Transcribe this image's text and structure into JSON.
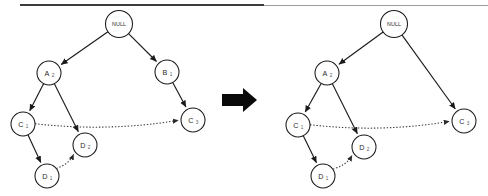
{
  "figure": {
    "canvas": {
      "width": 488,
      "height": 196
    },
    "divider": {
      "name": "top-horizontal-rule",
      "thick_from_x": 20,
      "thick_to_x": 264,
      "thin_to_x": 488,
      "y": 5
    },
    "transition_arrow": {
      "name": "transformation-arrow",
      "glyph": "right-arrow",
      "color": "#0a0a0a"
    },
    "colors": {
      "node_stroke": "#1a1a1a",
      "node_fill": "#ffffff",
      "solid_edge": "#1a1a1a",
      "dotted_edge": "#3a3a3a",
      "label_text": "#2b2b2b",
      "subscript_text": "#555555",
      "arrow_fill": "#0a0a0a",
      "rule_thick": "#3c3c3c",
      "rule_thin": "#8a8a8a"
    }
  },
  "diagrams": [
    {
      "id": "before",
      "name": "left-diagram-before",
      "nodes": [
        {
          "id": "null",
          "label": "NULL",
          "sub": "",
          "cx": 119,
          "cy": 24,
          "r": 13.5,
          "kind": "null"
        },
        {
          "id": "a2",
          "label": "A",
          "sub": "2",
          "cx": 49,
          "cy": 73,
          "r": 12.0,
          "kind": "normal"
        },
        {
          "id": "b1",
          "label": "B",
          "sub": "1",
          "cx": 167,
          "cy": 72,
          "r": 12.0,
          "kind": "normal"
        },
        {
          "id": "c1",
          "label": "C",
          "sub": "1",
          "cx": 23,
          "cy": 124,
          "r": 12.0,
          "kind": "normal"
        },
        {
          "id": "c3",
          "label": "C",
          "sub": "3",
          "cx": 193,
          "cy": 120,
          "r": 12.0,
          "kind": "normal"
        },
        {
          "id": "d2",
          "label": "D",
          "sub": "2",
          "cx": 85,
          "cy": 145,
          "r": 12.0,
          "kind": "normal"
        },
        {
          "id": "d1",
          "label": "D",
          "sub": "1",
          "cx": 47,
          "cy": 176,
          "r": 12.0,
          "kind": "normal"
        }
      ],
      "edges": [
        {
          "from": "null",
          "to": "a2",
          "style": "solid",
          "name": "edge-null-to-a"
        },
        {
          "from": "null",
          "to": "b1",
          "style": "solid",
          "name": "edge-null-to-b"
        },
        {
          "from": "a2",
          "to": "c1",
          "style": "solid",
          "name": "edge-a-to-c1"
        },
        {
          "from": "a2",
          "to": "d2",
          "style": "solid",
          "name": "edge-a-to-d2"
        },
        {
          "from": "b1",
          "to": "c3",
          "style": "solid",
          "name": "edge-b-to-c3"
        },
        {
          "from": "c1",
          "to": "d1",
          "style": "solid",
          "name": "edge-c1-to-d1"
        },
        {
          "from": "c1",
          "to": "c3",
          "style": "dotted",
          "name": "edge-c1-to-c3-dotted"
        },
        {
          "from": "d1",
          "to": "d2",
          "style": "dotted",
          "name": "edge-d1-to-d2-dotted"
        }
      ]
    },
    {
      "id": "after",
      "name": "right-diagram-after",
      "nodes": [
        {
          "id": "null",
          "label": "NULL",
          "sub": "",
          "cx": 394,
          "cy": 24,
          "r": 13.5,
          "kind": "null"
        },
        {
          "id": "a2",
          "label": "A",
          "sub": "2",
          "cx": 327,
          "cy": 73,
          "r": 12.0,
          "kind": "normal"
        },
        {
          "id": "c1",
          "label": "C",
          "sub": "1",
          "cx": 298,
          "cy": 125,
          "r": 12.0,
          "kind": "normal"
        },
        {
          "id": "c3",
          "label": "C",
          "sub": "3",
          "cx": 464,
          "cy": 121,
          "r": 12.0,
          "kind": "normal"
        },
        {
          "id": "d2",
          "label": "D",
          "sub": "2",
          "cx": 364,
          "cy": 147,
          "r": 12.0,
          "kind": "normal"
        },
        {
          "id": "d1",
          "label": "D",
          "sub": "1",
          "cx": 323,
          "cy": 176,
          "r": 12.0,
          "kind": "normal"
        }
      ],
      "edges": [
        {
          "from": "null",
          "to": "a2",
          "style": "solid",
          "name": "edge-null-to-a"
        },
        {
          "from": "null",
          "to": "c3",
          "style": "solid",
          "name": "edge-null-to-c3"
        },
        {
          "from": "a2",
          "to": "c1",
          "style": "solid",
          "name": "edge-a-to-c1"
        },
        {
          "from": "a2",
          "to": "d2",
          "style": "solid",
          "name": "edge-a-to-d2"
        },
        {
          "from": "c1",
          "to": "d1",
          "style": "solid",
          "name": "edge-c1-to-d1"
        },
        {
          "from": "c1",
          "to": "c3",
          "style": "dotted",
          "name": "edge-c1-to-c3-dotted"
        },
        {
          "from": "d1",
          "to": "d2",
          "style": "dotted",
          "name": "edge-d1-to-d2-dotted"
        }
      ]
    }
  ]
}
